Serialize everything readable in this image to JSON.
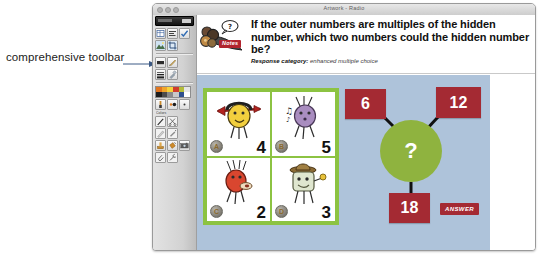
{
  "annotation": {
    "text": "comprehensive toolbar",
    "arrow_icon": "arrow-right-icon"
  },
  "window": {
    "title": "Artwork - Radio",
    "traffic_lights": [
      "close-dot",
      "minimize-dot",
      "zoom-dot"
    ]
  },
  "toolbar": {
    "aria_label": "comprehensive toolbar",
    "groups": [
      {
        "name": "layout-tools",
        "tools": [
          {
            "name": "table-tool-icon",
            "glyph": "grid"
          },
          {
            "name": "text-align-tool-icon",
            "glyph": "lines"
          },
          {
            "name": "checkmark-tool-icon",
            "glyph": "check"
          }
        ]
      },
      {
        "name": "image-tools",
        "tools": [
          {
            "name": "mountain-image-icon",
            "glyph": "photo"
          },
          {
            "name": "crop-tool-icon",
            "glyph": "crop"
          }
        ]
      },
      {
        "name": "shape-tools",
        "tools": [
          {
            "name": "rectangle-shape-icon",
            "glyph": "rect"
          },
          {
            "name": "pencil-tool-icon",
            "glyph": "pencil"
          }
        ]
      },
      {
        "name": "stroke-tools",
        "tools": [
          {
            "name": "line-weight-icon",
            "glyph": "weight"
          },
          {
            "name": "eyedropper-tool-icon",
            "glyph": "dropper"
          }
        ]
      },
      {
        "name": "brush-tools",
        "tools": [
          {
            "name": "brush-tool-icon",
            "glyph": "brush"
          },
          {
            "name": "scissors-tool-icon",
            "glyph": "scissors"
          }
        ]
      },
      {
        "name": "draw-tools",
        "tools": [
          {
            "name": "pen-tool-icon",
            "glyph": "pen"
          },
          {
            "name": "marker-tool-icon",
            "glyph": "marker"
          }
        ]
      },
      {
        "name": "media-tools",
        "tools": [
          {
            "name": "stamp-tool-icon",
            "glyph": "stamp"
          },
          {
            "name": "paint-bucket-icon",
            "glyph": "bucket"
          },
          {
            "name": "camera-tool-icon",
            "glyph": "camera"
          }
        ]
      },
      {
        "name": "misc-tools",
        "tools": [
          {
            "name": "paperclip-icon",
            "glyph": "clip"
          },
          {
            "name": "wrench-tool-icon",
            "glyph": "wrench"
          }
        ]
      }
    ],
    "swatch_label": "Colors",
    "palette_rows": [
      [
        "#e2761f",
        "#f0a52a",
        "#f5d33c",
        "#d13c2c",
        "#b4bd3a",
        "#e6e6e6"
      ],
      [
        "#1d1d1d",
        "#4c4c4c",
        "#8a8a8a",
        "#c9c9c9",
        "#2f4f8f",
        "#ffffff"
      ]
    ]
  },
  "question": {
    "mascot_icon": "notes-mascot-icon",
    "notes_badge": "Notes",
    "text": "If the outer numbers are multiples of the hidden number, which two numbers could the hidden number be?",
    "meta_key": "Response category:",
    "meta_value": "enhanced multiple choice"
  },
  "choices": [
    {
      "letter": "A",
      "value": "4",
      "monster": {
        "name": "yellow-arrow-monster-icon",
        "body": "#f2cf3e",
        "accent": "#b2231f"
      }
    },
    {
      "letter": "B",
      "value": "5",
      "monster": {
        "name": "purple-music-monster-icon",
        "body": "#a98dc0",
        "accent": "#4b4b4b"
      }
    },
    {
      "letter": "C",
      "value": "2",
      "monster": {
        "name": "red-spiky-monster-icon",
        "body": "#d9462f",
        "accent": "#8a3020"
      }
    },
    {
      "letter": "D",
      "value": "3",
      "monster": {
        "name": "cowboy-hat-monster-icon",
        "body": "#dfe6cf",
        "accent": "#8a6a34"
      }
    }
  ],
  "diagram": {
    "hidden_label": "?",
    "outer_numbers": [
      {
        "name": "outer-number-top-left",
        "value": "6"
      },
      {
        "name": "outer-number-top-right",
        "value": "12"
      },
      {
        "name": "outer-number-bottom",
        "value": "18"
      }
    ],
    "answer_button": "ANSWER"
  },
  "colors": {
    "stage_background": "#aec3da",
    "grid_border": "#8cc342",
    "hub_green": "#8fb33f",
    "box_red": "#a42a33",
    "badge_red": "#b1242e"
  }
}
